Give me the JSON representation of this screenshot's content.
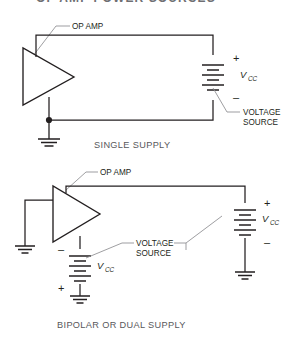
{
  "page": {
    "header_title": "OP AMP  POWER SOURCES",
    "background": "#ffffff",
    "ink": "#231f20",
    "leader_color": "#8c8c90",
    "caption_color": "#58585b"
  },
  "figures": [
    {
      "id": "single-supply",
      "caption": "SINGLE SUPPLY",
      "opamp_label": "OP AMP",
      "source_label": "VOLTAGE SOURCE",
      "source_label_line1": "VOLTAGE",
      "source_label_line2": "SOURCE",
      "battery": {
        "plus": "+",
        "minus": "–",
        "name": "V",
        "subscript": "CC",
        "plus_on_top": true
      }
    },
    {
      "id": "bipolar-dual-supply",
      "caption": "BIPOLAR OR DUAL SUPPLY",
      "opamp_label": "OP AMP",
      "source_label_line1": "VOLTAGE",
      "source_label_line2": "SOURCE",
      "battery_right": {
        "plus": "+",
        "minus": "–",
        "name": "V",
        "subscript": "CC",
        "plus_on_top": true
      },
      "battery_bottom": {
        "plus": "+",
        "minus": "–",
        "name": "V",
        "subscript": "CC",
        "plus_on_top": false
      }
    }
  ]
}
